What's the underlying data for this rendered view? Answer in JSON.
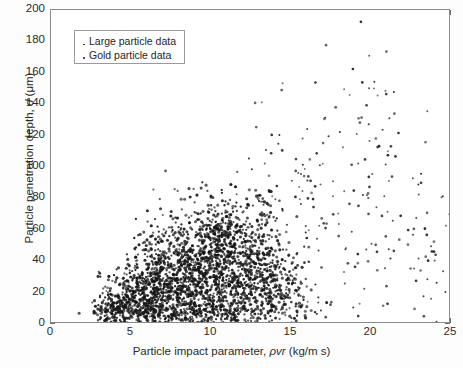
{
  "chart_data": {
    "type": "scatter",
    "title": "",
    "xlabel": "Particle impact parameter, ρvr (kg/m s)",
    "xlabel_parts": {
      "pre": "Particle impact parameter, ",
      "sym": "ρvr",
      "post": " (kg/m s)"
    },
    "ylabel": "Particle penetration depth, d (μm)",
    "ylabel_parts": {
      "pre": "Particle penetration depth, ",
      "sym": "d",
      "post": " (μm)"
    },
    "xlim": [
      0,
      25
    ],
    "ylim": [
      0,
      200
    ],
    "xticks": [
      0,
      5,
      10,
      15,
      20,
      25
    ],
    "yticks": [
      0,
      20,
      40,
      60,
      80,
      100,
      120,
      140,
      160,
      180,
      200
    ],
    "grid": false,
    "legend_position": "upper-left-inside",
    "marker_color": "#1c1c1c",
    "frame_color": "#8a8a8a",
    "background": "#ffffff",
    "series": [
      {
        "name": "Large particle data",
        "marker": "dot-small",
        "n_points": 320,
        "description": "Sparse scattered points spanning the full impact-parameter range with penetration depths up to ~170 um; pronounced vertical clusters near impact parameter 16 and 20.",
        "clusters": [
          {
            "cx": 4.3,
            "cy": 18,
            "sx": 1.1,
            "sy": 12,
            "n": 14
          },
          {
            "cx": 7.5,
            "cy": 35,
            "sx": 1.6,
            "sy": 20,
            "n": 22
          },
          {
            "cx": 10.5,
            "cy": 55,
            "sx": 1.8,
            "sy": 26,
            "n": 28
          },
          {
            "cx": 13.5,
            "cy": 72,
            "sx": 1.7,
            "sy": 30,
            "n": 30
          },
          {
            "cx": 16.2,
            "cy": 70,
            "sx": 0.9,
            "sy": 36,
            "n": 46
          },
          {
            "cx": 20.1,
            "cy": 85,
            "sx": 1.0,
            "sy": 38,
            "n": 52
          },
          {
            "cx": 17.8,
            "cy": 45,
            "sx": 1.9,
            "sy": 26,
            "n": 34
          },
          {
            "cx": 22.3,
            "cy": 55,
            "sx": 1.5,
            "sy": 30,
            "n": 30
          },
          {
            "cx": 23.8,
            "cy": 45,
            "sx": 0.9,
            "sy": 26,
            "n": 18
          },
          {
            "cx": 15.0,
            "cy": 125,
            "sx": 2.2,
            "sy": 22,
            "n": 14
          },
          {
            "cx": 20.0,
            "cy": 135,
            "sx": 1.6,
            "sy": 22,
            "n": 12
          }
        ]
      },
      {
        "name": "Gold particle data",
        "marker": "dot",
        "n_points": 2600,
        "description": "Very dense cloud rising from impact parameter ~2.8 to ~15, penetration depth 0-90 um, densest between 6 and 13 with a concentrated knot near impact parameter 10.5 and depth 55 um.",
        "clusters": [
          {
            "cx": 3.6,
            "cy": 8,
            "sx": 0.6,
            "sy": 6,
            "n": 90
          },
          {
            "cx": 4.6,
            "cy": 14,
            "sx": 0.8,
            "sy": 9,
            "n": 180
          },
          {
            "cx": 5.8,
            "cy": 18,
            "sx": 0.9,
            "sy": 11,
            "n": 230
          },
          {
            "cx": 7.0,
            "cy": 23,
            "sx": 1.0,
            "sy": 14,
            "n": 300
          },
          {
            "cx": 8.3,
            "cy": 27,
            "sx": 1.1,
            "sy": 16,
            "n": 340
          },
          {
            "cx": 9.6,
            "cy": 30,
            "sx": 1.1,
            "sy": 18,
            "n": 330
          },
          {
            "cx": 10.9,
            "cy": 32,
            "sx": 1.1,
            "sy": 18,
            "n": 300
          },
          {
            "cx": 12.2,
            "cy": 30,
            "sx": 1.1,
            "sy": 18,
            "n": 240
          },
          {
            "cx": 13.4,
            "cy": 26,
            "sx": 1.0,
            "sy": 16,
            "n": 170
          },
          {
            "cx": 14.4,
            "cy": 20,
            "sx": 0.9,
            "sy": 13,
            "n": 110
          },
          {
            "cx": 10.6,
            "cy": 58,
            "sx": 0.7,
            "sy": 8,
            "n": 150
          },
          {
            "cx": 7.6,
            "cy": 48,
            "sx": 1.1,
            "sy": 11,
            "n": 90
          },
          {
            "cx": 12.0,
            "cy": 52,
            "sx": 1.3,
            "sy": 14,
            "n": 110
          },
          {
            "cx": 6.3,
            "cy": 6,
            "sx": 1.6,
            "sy": 5,
            "n": 80
          },
          {
            "cx": 9.0,
            "cy": 6,
            "sx": 2.0,
            "sy": 5,
            "n": 90
          },
          {
            "cx": 12.0,
            "cy": 6,
            "sx": 2.0,
            "sy": 5,
            "n": 70
          },
          {
            "cx": 13.0,
            "cy": 70,
            "sx": 1.2,
            "sy": 12,
            "n": 40
          },
          {
            "cx": 9.8,
            "cy": 78,
            "sx": 1.4,
            "sy": 10,
            "n": 30
          }
        ]
      }
    ]
  },
  "legend": {
    "items": [
      {
        "label": "Large particle data",
        "marker": "dot-small"
      },
      {
        "label": "Gold particle data",
        "marker": "dot"
      }
    ]
  },
  "axes": {
    "x_tick_labels": [
      "0",
      "5",
      "10",
      "15",
      "20",
      "25"
    ],
    "y_tick_labels": [
      "0",
      "20",
      "40",
      "60",
      "80",
      "100",
      "120",
      "140",
      "160",
      "180",
      "200"
    ]
  }
}
